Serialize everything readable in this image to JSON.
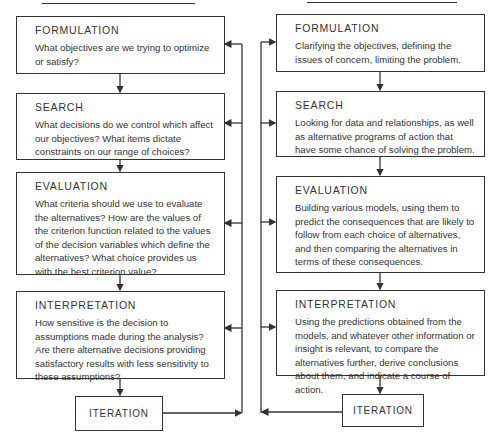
{
  "diagram": {
    "left_column": {
      "steps": [
        {
          "title": "FORMULATION",
          "text": "What objectives are we trying to optimize or satisfy?"
        },
        {
          "title": "SEARCH",
          "text": "What decisions do we control which affect our objectives?  What items dictate constraints on our range of choices?"
        },
        {
          "title": "EVALUATION",
          "text": "What criteria should we use to evaluate the alternatives?  How are the values of the criterion function related to the values of the decision variables which define the alternatives?  What choice provides us with the best criterion value?"
        },
        {
          "title": "INTERPRETATION",
          "text": "How sensitive is the decision to assumptions made during the analysis?  Are there alternative decisions providing satisfactory results with less sensitivity to these assumptions?"
        }
      ],
      "iteration_label": "ITERATION"
    },
    "right_column": {
      "steps": [
        {
          "title": "FORMULATION",
          "text": "Clarifying the objectives, defining the issues of concern, limiting the problem."
        },
        {
          "title": "SEARCH",
          "text": "Looking for data and relationships, as well as alternative programs of action that have some chance of solving the problem."
        },
        {
          "title": "EVALUATION",
          "text": "Building various models, using them to predict the consequences that are likely to follow from each choice of alternatives, and then comparing the alternatives in terms of these consequences."
        },
        {
          "title": "INTERPRETATION",
          "text": "Using the predictions obtained from the models, and whatever other information or insight is relevant, to compare the alternatives further, derive conclusions about them, and indicate a course of action."
        }
      ],
      "iteration_label": "ITERATION"
    },
    "colors": {
      "line": "#333333",
      "background": "#ffffff"
    }
  }
}
